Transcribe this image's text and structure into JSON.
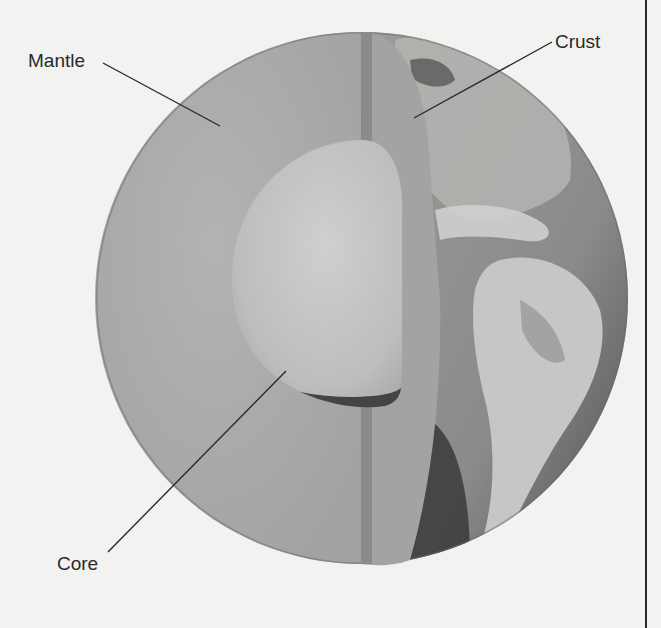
{
  "diagram": {
    "labels": [
      {
        "id": "mantle",
        "text": "Mantle"
      },
      {
        "id": "crust",
        "text": "Crust"
      },
      {
        "id": "core",
        "text": "Core"
      }
    ],
    "colors": {
      "background": "#f2f2f0",
      "mantle": "#a9a9a7",
      "core": "#c4c4c2",
      "crust_band": "#9a9a98",
      "ocean": "#8e8e8c",
      "land": "#c8c8c6",
      "leader_line": "#2a2a2a",
      "label_text": "#2a2a2a"
    }
  }
}
